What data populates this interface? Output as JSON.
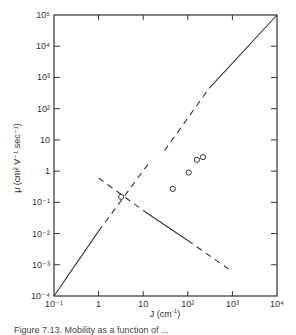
{
  "chart_data": {
    "type": "line",
    "title": "",
    "xlabel": "J (cm⁻¹)",
    "ylabel": "μ (cm² V⁻¹ sec⁻¹)",
    "xscale": "log",
    "yscale": "log",
    "xlim": [
      0.1,
      10000
    ],
    "ylim": [
      0.0001,
      100000
    ],
    "grid": false,
    "legend": null,
    "x_tick_labels": [
      "10⁻¹",
      "1",
      "10",
      "10²",
      "10³",
      "10⁴"
    ],
    "y_tick_labels": [
      "10⁻⁴",
      "10⁻³",
      "10⁻²",
      "10⁻¹",
      "1",
      "10",
      "10²",
      "10³",
      "10⁴",
      "10⁵"
    ],
    "series": [
      {
        "name": "rising-lower",
        "style": "solid then dashed",
        "segments": [
          {
            "style": "solid",
            "x": [
              0.1,
              1.0
            ],
            "y": [
              0.0001,
              0.012
            ]
          },
          {
            "style": "dashed",
            "x": [
              1.0,
              13
            ],
            "y": [
              0.012,
              1.7
            ]
          }
        ]
      },
      {
        "name": "rising-upper",
        "style": "dashed then solid",
        "segments": [
          {
            "style": "dashed",
            "x": [
              30,
              300
            ],
            "y": [
              4.5,
              450
            ]
          },
          {
            "style": "solid",
            "x": [
              300,
              10000
            ],
            "y": [
              450,
              100000
            ]
          }
        ]
      },
      {
        "name": "descending",
        "style": "dashed, solid, dashed",
        "segments": [
          {
            "style": "dashed",
            "x": [
              1.0,
              10
            ],
            "y": [
              0.6,
              0.055
            ]
          },
          {
            "style": "solid",
            "x": [
              10,
              100
            ],
            "y": [
              0.055,
              0.006
            ]
          },
          {
            "style": "dashed",
            "x": [
              100,
              1000
            ],
            "y": [
              0.006,
              0.0006
            ]
          }
        ]
      },
      {
        "name": "measured points",
        "style": "open circles",
        "x": [
          3.2,
          46,
          105,
          160,
          220
        ],
        "y": [
          0.15,
          0.27,
          0.9,
          2.3,
          2.8
        ]
      }
    ],
    "caption": "Figure 7.13. Mobility as a function of ..."
  },
  "axes": {
    "x_title": "J (cm",
    "x_title_sup": "-1",
    "x_title_end": ")",
    "y_title": "μ (cm² V⁻¹ sec⁻¹)"
  },
  "caption": "Figure 7.13. Mobility as a function of ..."
}
